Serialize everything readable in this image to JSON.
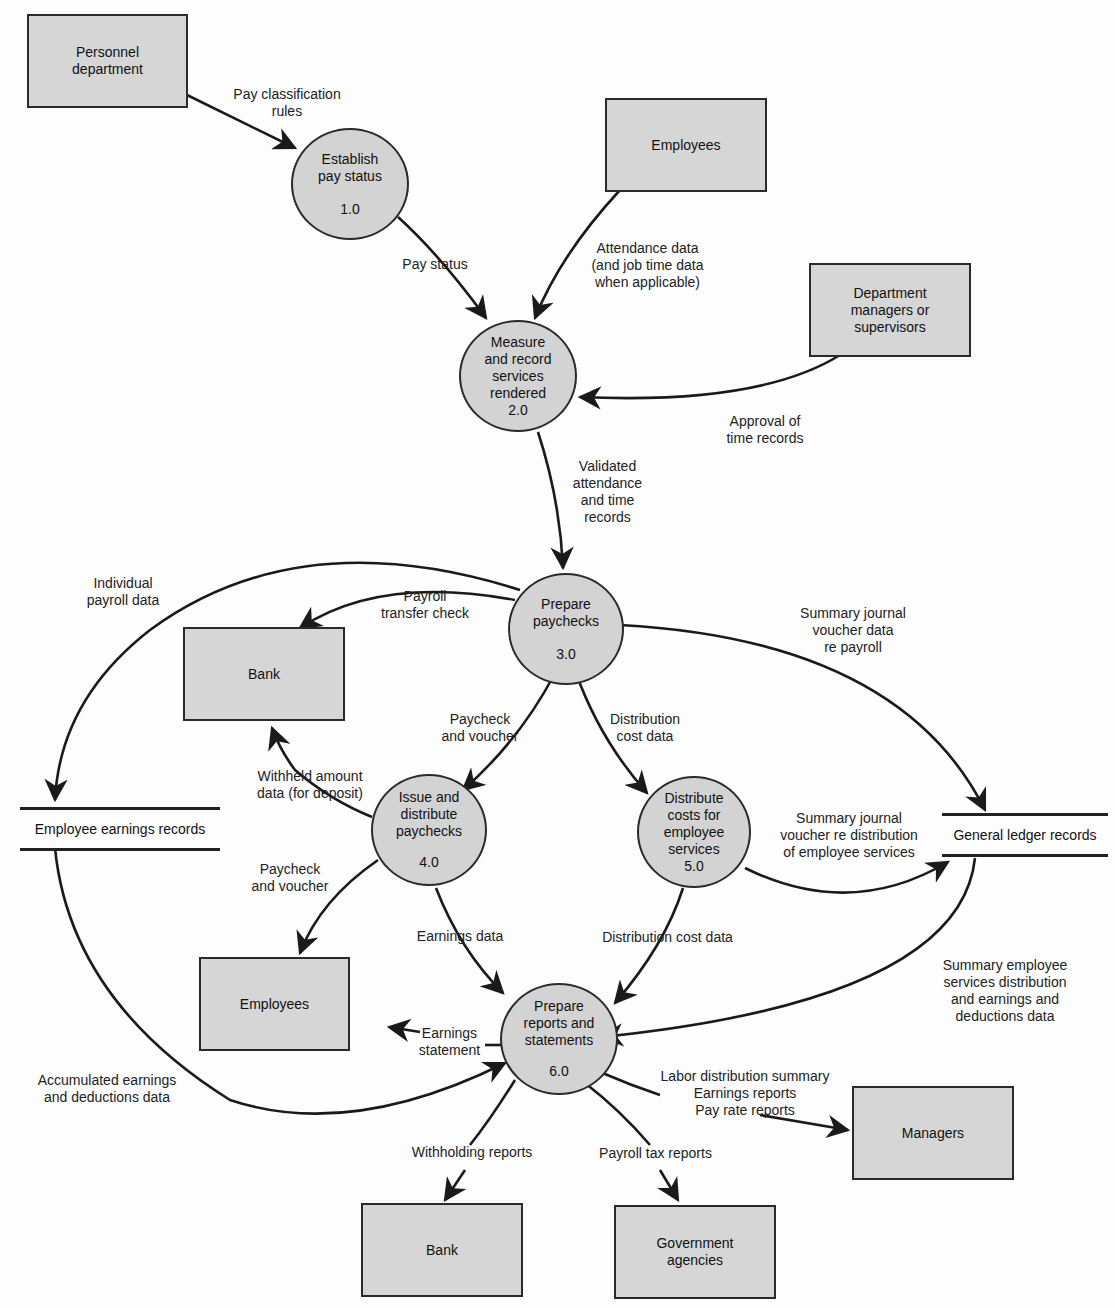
{
  "entities": {
    "personnel": "Personnel\ndepartment",
    "employees_top": "Employees",
    "dept_managers": "Department\nmanagers or\nsupervisors",
    "bank_mid": "Bank",
    "employees_bottom": "Employees",
    "managers": "Managers",
    "bank_bottom": "Bank",
    "government": "Government\nagencies"
  },
  "processes": [
    {
      "id": "1.0",
      "label": "Establish\npay status",
      "number": "1.0"
    },
    {
      "id": "2.0",
      "label": "Measure\nand record\nservices\nrendered",
      "number": "2.0"
    },
    {
      "id": "3.0",
      "label": "Prepare\npaychecks",
      "number": "3.0"
    },
    {
      "id": "4.0",
      "label": "Issue and\ndistribute\npaychecks",
      "number": "4.0"
    },
    {
      "id": "5.0",
      "label": "Distribute\ncosts for\nemployee\nservices",
      "number": "5.0"
    },
    {
      "id": "6.0",
      "label": "Prepare\nreports and\nstatements",
      "number": "6.0"
    }
  ],
  "stores": {
    "employee_earnings": "Employee earnings records",
    "general_ledger": "General ledger records"
  },
  "flows": {
    "pay_classification": "Pay classification\nrules",
    "pay_status": "Pay status",
    "attendance": "Attendance data\n(and job time data\nwhen applicable)",
    "approval": "Approval of\ntime records",
    "validated": "Validated\nattendance\nand time\nrecords",
    "individual_payroll": "Individual\npayroll data",
    "payroll_transfer": "Payroll\ntransfer check",
    "summary_journal_payroll": "Summary journal\nvoucher data\nre payroll",
    "paycheck_voucher_1": "Paycheck\nand voucher",
    "distribution_cost_1": "Distribution\ncost data",
    "withheld": "Withheld amount\ndata (for deposit)",
    "summary_journal_distribution": "Summary journal\nvoucher re distribution\nof employee services",
    "paycheck_voucher_2": "Paycheck\nand voucher",
    "earnings_data": "Earnings data",
    "distribution_cost_2": "Distribution cost data",
    "summary_employee_services": "Summary employee\nservices distribution\nand earnings and\ndeductions data",
    "earnings_statement": "Earnings\nstatement",
    "accumulated": "Accumulated earnings\nand deductions data",
    "manager_reports": "Labor distribution summary\nEarnings reports\nPay rate reports",
    "withholding_reports": "Withholding reports",
    "payroll_tax_reports": "Payroll tax reports"
  }
}
